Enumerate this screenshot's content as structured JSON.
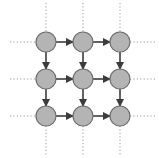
{
  "diagram": {
    "type": "grid-graph",
    "rows": 3,
    "cols": 3,
    "colors": {
      "background": "#ffffff",
      "node_fill": "#b4b4b4",
      "node_stroke": "#6e6e6e",
      "edge": "#3c3c3c",
      "dotted": "#9a9a9a"
    },
    "layout": {
      "x_positions": [
        46,
        83,
        120
      ],
      "y_positions": [
        42,
        79,
        116
      ],
      "node_radius": 10,
      "dotted_extent": {
        "left": 10,
        "right": 157,
        "top": 3,
        "bottom": 155
      }
    },
    "nodes": [
      {
        "id": "n00",
        "row": 0,
        "col": 0
      },
      {
        "id": "n01",
        "row": 0,
        "col": 1
      },
      {
        "id": "n02",
        "row": 0,
        "col": 2
      },
      {
        "id": "n10",
        "row": 1,
        "col": 0
      },
      {
        "id": "n11",
        "row": 1,
        "col": 1
      },
      {
        "id": "n12",
        "row": 1,
        "col": 2
      },
      {
        "id": "n20",
        "row": 2,
        "col": 0
      },
      {
        "id": "n21",
        "row": 2,
        "col": 1
      },
      {
        "id": "n22",
        "row": 2,
        "col": 2
      }
    ],
    "edges": [
      {
        "from": "n00",
        "to": "n01",
        "direction": "right"
      },
      {
        "from": "n01",
        "to": "n02",
        "direction": "right"
      },
      {
        "from": "n10",
        "to": "n11",
        "direction": "right"
      },
      {
        "from": "n11",
        "to": "n12",
        "direction": "right"
      },
      {
        "from": "n20",
        "to": "n21",
        "direction": "right"
      },
      {
        "from": "n21",
        "to": "n22",
        "direction": "right"
      },
      {
        "from": "n00",
        "to": "n10",
        "direction": "down"
      },
      {
        "from": "n10",
        "to": "n20",
        "direction": "down"
      },
      {
        "from": "n01",
        "to": "n11",
        "direction": "down"
      },
      {
        "from": "n11",
        "to": "n21",
        "direction": "down"
      },
      {
        "from": "n02",
        "to": "n12",
        "direction": "down"
      },
      {
        "from": "n12",
        "to": "n22",
        "direction": "down"
      }
    ],
    "continuation_lines": "dotted lines extend left and right of each row and above and below each column"
  }
}
